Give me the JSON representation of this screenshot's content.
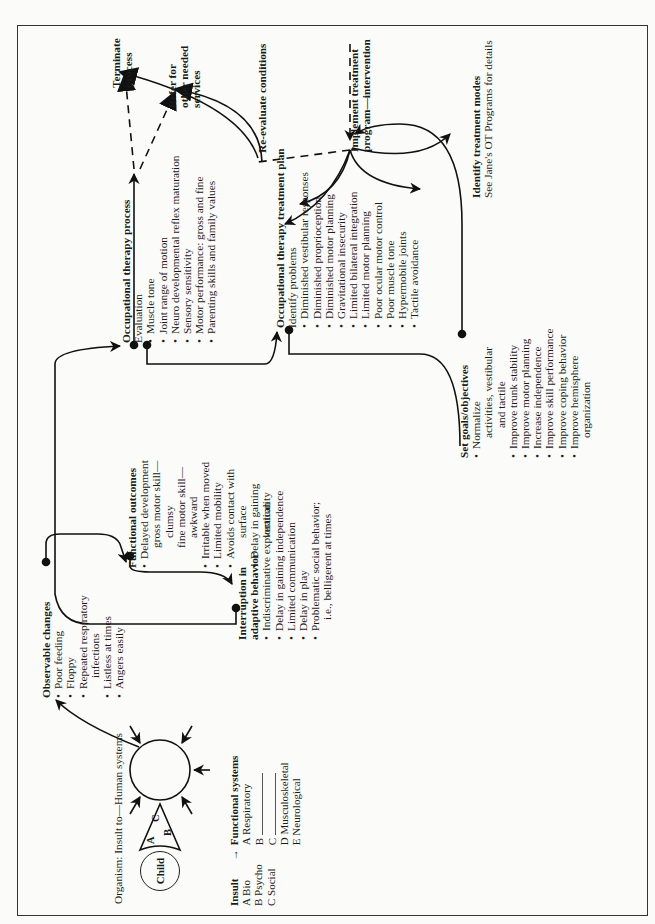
{
  "diagram": {
    "organism_caption": "Organism: Insult to—Human systems",
    "child_label": "Child",
    "cone_labels": [
      "A",
      "B",
      "C"
    ],
    "legend": {
      "insult_header": "Insult",
      "arrow": "→",
      "systems_header": "Functional systems",
      "insult_items": [
        "A Bio",
        "B Psycho",
        "C Social"
      ],
      "system_items": [
        {
          "letter": "A",
          "label": "Respiratory"
        },
        {
          "letter": "B",
          "label": ""
        },
        {
          "letter": "C",
          "label": ""
        },
        {
          "letter": "D",
          "label": "Musculoskeletal"
        },
        {
          "letter": "E",
          "label": "Neurological"
        }
      ]
    },
    "observable_changes": {
      "title": "Observable changes",
      "items": [
        "Poor feeding",
        "Floppy",
        "Repeated respiratory",
        "infections",
        "Listless at times",
        "Angers easily"
      ]
    },
    "functional_outcomes": {
      "title": "Functional outcomes",
      "items": [
        "Delayed development",
        "gross motor skill—",
        "clumsy",
        "fine motor skill—",
        "awkward",
        "Irritable when moved",
        "Limited mobility",
        "Avoids contact with",
        "surface",
        "Delay in gaining",
        "verticality"
      ]
    },
    "interruption": {
      "title_line1": "Interruption in",
      "title_line2": "adaptive behavior",
      "items": [
        "Indiscriminative exploration",
        "Delay in gaining independence",
        "Limited communication",
        "Delay in play",
        "Problematic social behavior;",
        "i.e., belligerent at times"
      ]
    },
    "ot_process": {
      "title": "Occupational therapy process",
      "subtitle": "Evaluation",
      "items": [
        "Muscle tone",
        "Joint range of motion",
        "Neuro developmental reflex maturation",
        "Sensory sensitivity",
        "Motor performance: gross and fine",
        "Parenting skills and family values"
      ]
    },
    "ot_treatment_plan": {
      "title": "Occupational therapy treatment plan",
      "subtitle": "Identify problems",
      "items": [
        "Diminished vestibular responses",
        "Diminished proprioception",
        "Diminished motor planning",
        "Gravitational insecurity",
        "Limited bilateral integration",
        "Limited motor planning",
        "Poor ocular motor control",
        "Poor muscle tone",
        "Hypermobile joints",
        "Tactile avoidance"
      ]
    },
    "set_goals": {
      "title": "Set goals/objectives",
      "items": [
        "Normalize",
        "activities, vestibular",
        "and tactile",
        "Improve trunk stability",
        "Improve motor planning",
        "Increase independence",
        "Improve skill performance",
        "Improve coping behavior",
        "Improve hemisphere",
        "organization"
      ]
    },
    "treatment_modes": {
      "title": "Identify treatment modes",
      "detail": "See Jane's OT Programs for details"
    },
    "implement": {
      "line1": "Implement treatment",
      "line2": "program—intervention"
    },
    "reevaluate": "Re-evaluate conditions",
    "terminate": {
      "line1": "Terminate",
      "line2": "process"
    },
    "refer": {
      "line1": "Refer for",
      "line2": "other needed",
      "line3": "services"
    }
  }
}
